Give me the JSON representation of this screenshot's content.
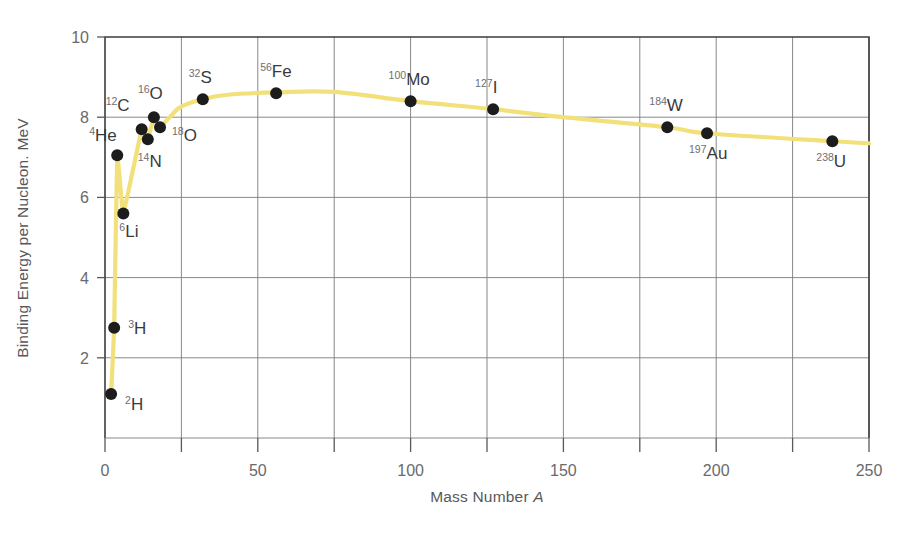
{
  "chart_data": {
    "type": "line",
    "title": "",
    "xlabel": "Mass Number A",
    "ylabel": "Binding Energy per Nucleon. MeV",
    "xlim": [
      0,
      250
    ],
    "ylim": [
      0,
      10
    ],
    "xticks": [
      0,
      50,
      100,
      150,
      200,
      250
    ],
    "xtick_labels": [
      "0",
      "50",
      "100",
      "150",
      "200",
      "250"
    ],
    "xminorticks": [
      25,
      75,
      125,
      175,
      225
    ],
    "yticks": [
      0,
      2,
      4,
      6,
      8,
      10
    ],
    "ytick_labels": [
      "0",
      "2",
      "4",
      "6",
      "8",
      "10"
    ],
    "grid": "both",
    "legend": "none",
    "line_color": "#f2e07a",
    "marker_color": "#1c1c1c",
    "x": [
      2,
      3,
      4,
      6,
      12,
      14,
      16,
      18,
      32,
      56,
      100,
      127,
      184,
      197,
      238
    ],
    "values": [
      1.1,
      2.75,
      7.05,
      5.6,
      7.7,
      7.45,
      8.0,
      7.75,
      8.45,
      8.6,
      8.4,
      8.2,
      7.75,
      7.6,
      7.4
    ],
    "points": [
      {
        "sup": "2",
        "sym": "H",
        "A": 2,
        "be": 1.1,
        "lx": 14,
        "ly": 16
      },
      {
        "sup": "3",
        "sym": "H",
        "A": 3,
        "be": 2.75,
        "lx": 14,
        "ly": 6
      },
      {
        "sup": "4",
        "sym": "He",
        "A": 4,
        "be": 7.05,
        "lx": -28,
        "ly": -14
      },
      {
        "sup": "6",
        "sym": "Li",
        "A": 6,
        "be": 5.6,
        "lx": -4,
        "ly": 24
      },
      {
        "sup": "12",
        "sym": "C",
        "A": 12,
        "be": 7.7,
        "lx": -36,
        "ly": -18
      },
      {
        "sup": "14",
        "sym": "N",
        "A": 14,
        "be": 7.45,
        "lx": -10,
        "ly": 28
      },
      {
        "sup": "16",
        "sym": "O",
        "A": 16,
        "be": 8.0,
        "lx": -16,
        "ly": -18
      },
      {
        "sup": "18",
        "sym": "O",
        "A": 18,
        "be": 7.75,
        "lx": 12,
        "ly": 14
      },
      {
        "sup": "32",
        "sym": "S",
        "A": 32,
        "be": 8.45,
        "lx": -14,
        "ly": -16
      },
      {
        "sup": "56",
        "sym": "Fe",
        "A": 56,
        "be": 8.6,
        "lx": -16,
        "ly": -16
      },
      {
        "sup": "100",
        "sym": "Mo",
        "A": 100,
        "be": 8.4,
        "lx": -22,
        "ly": -16
      },
      {
        "sup": "127",
        "sym": "I",
        "A": 127,
        "be": 8.2,
        "lx": -18,
        "ly": -16
      },
      {
        "sup": "184",
        "sym": "W",
        "A": 184,
        "be": 7.75,
        "lx": -18,
        "ly": -16
      },
      {
        "sup": "197",
        "sym": "Au",
        "A": 197,
        "be": 7.6,
        "lx": -18,
        "ly": 26
      },
      {
        "sup": "238",
        "sym": "U",
        "A": 238,
        "be": 7.4,
        "lx": -16,
        "ly": 26
      }
    ],
    "curve": [
      [
        2,
        1.1
      ],
      [
        3,
        2.75
      ],
      [
        4,
        7.05
      ],
      [
        6,
        5.6
      ],
      [
        12,
        7.7
      ],
      [
        14,
        7.45
      ],
      [
        16,
        8.0
      ],
      [
        18,
        7.75
      ],
      [
        24,
        8.22
      ],
      [
        32,
        8.45
      ],
      [
        40,
        8.56
      ],
      [
        56,
        8.62
      ],
      [
        75,
        8.63
      ],
      [
        100,
        8.4
      ],
      [
        127,
        8.2
      ],
      [
        150,
        8.0
      ],
      [
        184,
        7.75
      ],
      [
        197,
        7.6
      ],
      [
        238,
        7.4
      ],
      [
        250,
        7.35
      ]
    ]
  }
}
